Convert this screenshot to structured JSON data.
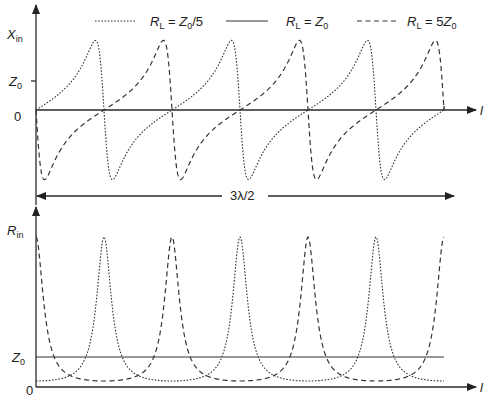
{
  "chart_data": [
    {
      "type": "line",
      "title": "",
      "ylabel_main": "X",
      "ylabel_sub": "in",
      "xlabel": "l",
      "y_tick_labels": [
        {
          "main": "Z",
          "sub": "0",
          "value": 1
        },
        {
          "main": "0",
          "sub": "",
          "value": 0
        }
      ],
      "x_range_wavelengths": [
        0,
        1.5
      ],
      "ylim_Z0": [
        -2.6,
        2.8
      ],
      "span_annotation": "3λ/2",
      "series": [
        {
          "name": "R_L = Z0/5",
          "style": "dotted",
          "load_ratio": 0.2,
          "quantity": "reactance"
        },
        {
          "name": "R_L = Z0",
          "style": "solid",
          "load_ratio": 1,
          "quantity": "reactance"
        },
        {
          "name": "R_L = 5Z0",
          "style": "dashed",
          "load_ratio": 5,
          "quantity": "reactance"
        }
      ],
      "peak_value_Z0": 2.4,
      "trough_value_Z0": -2.4
    },
    {
      "type": "line",
      "title": "",
      "ylabel_main": "R",
      "ylabel_sub": "in",
      "xlabel": "l",
      "y_tick_labels": [
        {
          "main": "Z",
          "sub": "0",
          "value": 1
        },
        {
          "main": "0",
          "sub": "",
          "value": 0
        }
      ],
      "x_range_wavelengths": [
        0,
        1.5
      ],
      "ylim_Z0": [
        0,
        5.9
      ],
      "series": [
        {
          "name": "R_L = Z0/5",
          "style": "dotted",
          "load_ratio": 0.2,
          "quantity": "resistance"
        },
        {
          "name": "R_L = Z0",
          "style": "solid",
          "load_ratio": 1,
          "quantity": "resistance"
        },
        {
          "name": "R_L = 5Z0",
          "style": "dashed",
          "load_ratio": 5,
          "quantity": "resistance"
        }
      ],
      "peak_value_Z0": 5,
      "min_value_Z0": 0.2
    }
  ],
  "legend": {
    "placement": "top",
    "items": [
      {
        "style": "dotted",
        "r": "R",
        "rsub": "L",
        "eq": " = ",
        "z": "Z",
        "zsub": "0",
        "tail": "/5",
        "pre": ""
      },
      {
        "style": "solid",
        "r": "R",
        "rsub": "L",
        "eq": " = ",
        "z": "Z",
        "zsub": "0",
        "tail": "",
        "pre": ""
      },
      {
        "style": "dashed",
        "r": "R",
        "rsub": "L",
        "eq": " = ",
        "z": "Z",
        "zsub": "0",
        "tail": "",
        "pre": "5"
      }
    ]
  }
}
